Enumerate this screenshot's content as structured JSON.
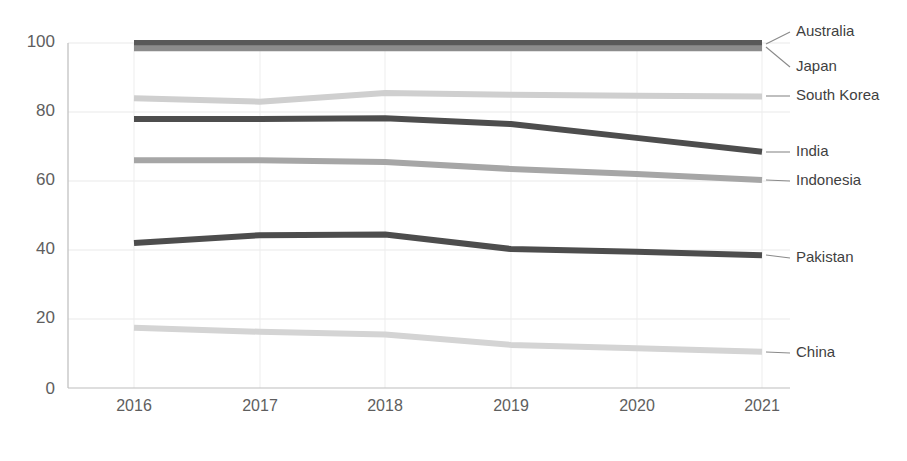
{
  "chart_data": {
    "type": "line",
    "title": "",
    "subtitle": "",
    "xlabel": "",
    "ylabel": "",
    "categories": [
      "2016",
      "2017",
      "2018",
      "2019",
      "2020",
      "2021"
    ],
    "x": [
      2016,
      2017,
      2018,
      2019,
      2020,
      2021
    ],
    "xlim": [
      2016,
      2021
    ],
    "ylim": [
      0,
      100
    ],
    "y_ticks": [
      "0",
      "20",
      "40",
      "60",
      "80",
      "100"
    ],
    "y_tick_values": [
      0,
      20,
      40,
      60,
      80,
      100
    ],
    "grid": "horizontal-and-vertical",
    "legend_position": "right-inline-labels",
    "series": [
      {
        "name": "Australia",
        "values": [
          100,
          100,
          100,
          100,
          100,
          100
        ],
        "color": "#595959",
        "label_value": "Australia"
      },
      {
        "name": "Japan",
        "values": [
          98.5,
          98.5,
          98.5,
          98.5,
          98.5,
          98.5
        ],
        "color": "#8c8c8c",
        "label_value": "Japan"
      },
      {
        "name": "South Korea",
        "values": [
          84,
          83,
          85.5,
          85,
          84.7,
          84.5
        ],
        "color": "#cfcfcf",
        "label_value": "South Korea"
      },
      {
        "name": "India",
        "values": [
          78,
          78,
          78.2,
          76.5,
          72.5,
          68.5
        ],
        "color": "#4d4d4d",
        "label_value": "India"
      },
      {
        "name": "Indonesia",
        "values": [
          66,
          66,
          65.5,
          63.5,
          62,
          60.3
        ],
        "color": "#a6a6a6",
        "label_value": "Indonesia"
      },
      {
        "name": "Pakistan",
        "values": [
          42,
          44.3,
          44.5,
          40.3,
          39.5,
          38.5
        ],
        "color": "#4d4d4d",
        "label_value": "Pakistan"
      },
      {
        "name": "China",
        "values": [
          17.5,
          16.3,
          15.5,
          12.5,
          11.5,
          10.5
        ],
        "color": "#d4d4d4",
        "label_value": "China"
      }
    ]
  },
  "axes": {
    "y_labels": [
      "100",
      "80",
      "60",
      "40",
      "20",
      "0"
    ],
    "x_labels": [
      "2016",
      "2017",
      "2018",
      "2019",
      "2020",
      "2021"
    ]
  },
  "labels": {
    "australia": "Australia",
    "japan": "Japan",
    "south_korea": "South Korea",
    "india": "India",
    "indonesia": "Indonesia",
    "pakistan": "Pakistan",
    "china": "China"
  }
}
